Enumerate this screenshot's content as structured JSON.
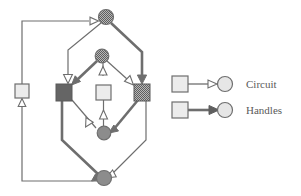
{
  "figure": {
    "title": "",
    "background_color": "#ffffff",
    "edge_color": "#6e6e6e",
    "node_stroke_color": "#6e6e6e"
  },
  "legend": {
    "position": "right",
    "entries": [
      {
        "label": "Circuit",
        "edge_style": "thin",
        "arrowhead": "hollow",
        "source_shape": "square",
        "source_fill": "#e8e8e8",
        "target_shape": "circle",
        "target_fill": "#e0e0e0"
      },
      {
        "label": "Handles",
        "edge_style": "thick",
        "arrowhead": "solid",
        "source_shape": "square",
        "source_fill": "#e8e8e8",
        "target_shape": "circle",
        "target_fill": "#e0e0e0"
      }
    ]
  },
  "graph": {
    "node_count": 8,
    "edge_count": 12,
    "nodes": [
      {
        "id": "c-top",
        "shape": "circle",
        "fill": "#8a8a8a",
        "pattern": "dither",
        "cx": 106,
        "cy": 17,
        "r": 7
      },
      {
        "id": "c-mid",
        "shape": "circle",
        "fill": "#8a8a8a",
        "pattern": "dither",
        "cx": 102,
        "cy": 56,
        "r": 6.5
      },
      {
        "id": "c-lower",
        "shape": "circle",
        "fill": "#808080",
        "pattern": "solid",
        "cx": 104,
        "cy": 133,
        "r": 6.5
      },
      {
        "id": "c-bottom",
        "shape": "circle",
        "fill": "#808080",
        "pattern": "solid",
        "cx": 104,
        "cy": 178,
        "r": 7
      },
      {
        "id": "s-left-outer",
        "shape": "square",
        "fill": "#ececec",
        "pattern": "light",
        "x": 15,
        "y": 84,
        "w": 14,
        "h": 14
      },
      {
        "id": "s-dark-left",
        "shape": "square",
        "fill": "#656565",
        "pattern": "solid",
        "x": 56,
        "y": 84,
        "w": 16,
        "h": 16
      },
      {
        "id": "s-center",
        "shape": "square",
        "fill": "#ececec",
        "pattern": "light",
        "x": 96,
        "y": 85,
        "w": 15,
        "h": 15
      },
      {
        "id": "s-dark-right",
        "shape": "square",
        "fill": "#8f8f8f",
        "pattern": "dither",
        "x": 134,
        "y": 84,
        "w": 16,
        "h": 16
      }
    ],
    "edges": [
      {
        "from": "c-bottom",
        "to": "s-left-outer",
        "type": "Circuit"
      },
      {
        "from": "s-left-outer",
        "to": "c-top",
        "type": "Circuit"
      },
      {
        "from": "c-top",
        "to": "s-dark-left",
        "type": "Circuit"
      },
      {
        "from": "c-top",
        "to": "s-dark-right",
        "type": "Handles"
      },
      {
        "from": "c-mid",
        "to": "s-dark-left",
        "type": "Handles"
      },
      {
        "from": "c-mid",
        "to": "s-dark-right",
        "type": "Circuit"
      },
      {
        "from": "c-mid",
        "to": "s-center",
        "type": "Circuit"
      },
      {
        "from": "s-center",
        "to": "c-lower",
        "type": "Circuit"
      },
      {
        "from": "s-dark-left",
        "to": "c-lower",
        "type": "Circuit"
      },
      {
        "from": "s-dark-right",
        "to": "c-lower",
        "type": "Handles"
      },
      {
        "from": "s-dark-left",
        "to": "c-bottom",
        "type": "Handles"
      },
      {
        "from": "s-dark-right",
        "to": "c-bottom",
        "type": "Circuit"
      }
    ]
  }
}
